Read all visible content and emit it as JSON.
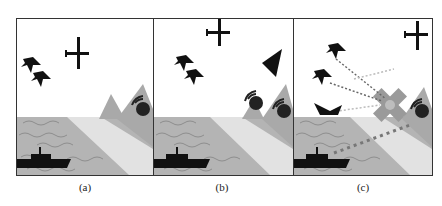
{
  "figure": {
    "panels": [
      {
        "id": "a",
        "label": "(a)",
        "description": "Two fighter jets and a surveillance aircraft over sea; warship at sea; radar station on mountains near shore"
      },
      {
        "id": "b",
        "label": "(b)",
        "description": "Fighter jets and surveillance aircraft; stealth triangle aircraft; two radar stations on shore and mountain; warship at sea"
      },
      {
        "id": "c",
        "label": "(c)",
        "description": "Fighter jets and ship send dotted-line links converging on a jammed/destroyed radar (X mark); warship at sea fires dotted trajectory; radar on mountain"
      }
    ],
    "colors": {
      "sea": "#b4b4b4",
      "wave": "#8e8e8e",
      "beach": "#e2e2e2",
      "mountain": "#a9a9a9",
      "silhouette": "#111111",
      "border": "#333333",
      "x_mark": "#9a9a9a"
    }
  }
}
